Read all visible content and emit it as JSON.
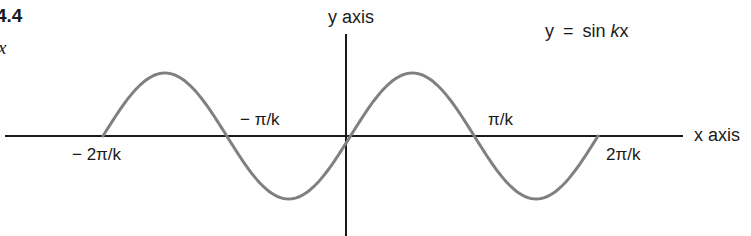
{
  "figure": {
    "number_label": "4.4",
    "sub_label": "x"
  },
  "equation": {
    "lhs": "y",
    "eq": "=",
    "fn": "sin",
    "arg_k": "k",
    "arg_x": "x"
  },
  "axes": {
    "y_label": "y axis",
    "x_label": "x axis"
  },
  "ticks": {
    "neg_2pi_k": "− 2π/k",
    "neg_pi_k": "− π/k",
    "pi_k": "π/k",
    "pos_2pi_k": "2π/k"
  },
  "colors": {
    "axis": "#1a1a1a",
    "curve": "#808080",
    "text": "#1a1a1a"
  },
  "chart_data": {
    "type": "line",
    "title": "y = sin kx",
    "xlabel": "x axis",
    "ylabel": "y axis",
    "x": [
      "-2π/k",
      "-3π/2k",
      "-π/k",
      "-π/2k",
      "0",
      "π/2k",
      "π/k",
      "3π/2k",
      "2π/k"
    ],
    "series": [
      {
        "name": "y = sin kx",
        "values": [
          0,
          1,
          0,
          -1,
          0,
          1,
          0,
          -1,
          0
        ]
      }
    ],
    "xlim": [
      "-2π/k",
      "2π/k"
    ],
    "ylim": [
      -1,
      1
    ],
    "grid": false
  }
}
